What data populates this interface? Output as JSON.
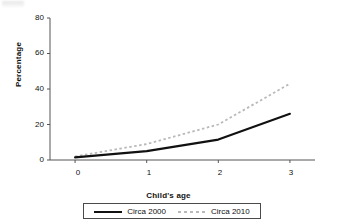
{
  "chart_data": {
    "type": "line",
    "title": "",
    "subtitle": "",
    "xlabel": "Child's age",
    "ylabel": "Percentage",
    "x": [
      0,
      1,
      2,
      3
    ],
    "xtick_labels": [
      "0",
      "1",
      "2",
      "3"
    ],
    "ytick_labels": [
      "0",
      "20",
      "40",
      "60",
      "80"
    ],
    "yticks": [
      0,
      20,
      40,
      60,
      80
    ],
    "xlim": [
      -0.35,
      3.35
    ],
    "ylim": [
      0,
      80
    ],
    "grid": false,
    "legend_position": "bottom",
    "series": [
      {
        "name": "Circa 2000",
        "values": [
          1.5,
          5,
          11.5,
          26
        ],
        "style": "solid",
        "color": "#111111"
      },
      {
        "name": "Circa 2010",
        "values": [
          2,
          9,
          20,
          43
        ],
        "style": "dotted",
        "color": "#b9b9b9"
      }
    ],
    "axis_color": "#555555"
  },
  "legend": {
    "entries": [
      {
        "label": "Circa 2000",
        "marker": "solid-line-swatch"
      },
      {
        "label": "Circa 2010",
        "marker": "dotted-line-swatch"
      }
    ]
  },
  "axes": {
    "y_label": "Percentage",
    "x_label": "Child's age",
    "y_ticks": [
      "80",
      "60",
      "40",
      "20",
      "0"
    ],
    "x_ticks": [
      "0",
      "1",
      "2",
      "3"
    ]
  }
}
